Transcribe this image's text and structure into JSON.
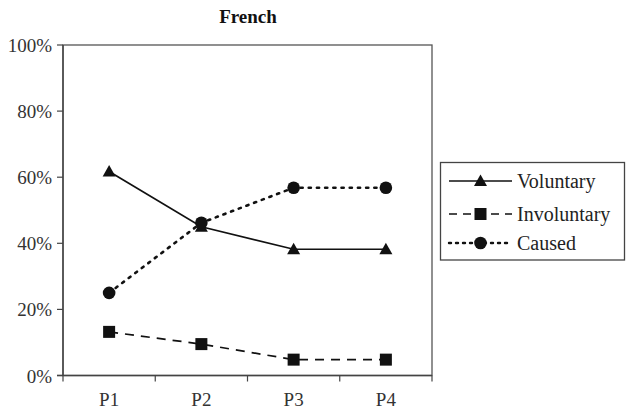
{
  "chart_data": {
    "type": "line",
    "title": "French",
    "xlabel": "",
    "ylabel": "",
    "categories": [
      "P1",
      "P2",
      "P3",
      "P4"
    ],
    "series": [
      {
        "name": "Voluntary",
        "values": [
          61.7,
          45.0,
          38.2,
          38.2
        ],
        "marker": "triangle",
        "line_style": "solid",
        "color": "#111111"
      },
      {
        "name": "Involuntary",
        "values": [
          13.2,
          9.5,
          4.8,
          4.8
        ],
        "marker": "square",
        "line_style": "dashed",
        "color": "#111111"
      },
      {
        "name": "Caused",
        "values": [
          25.0,
          46.2,
          56.8,
          56.8
        ],
        "marker": "circle",
        "line_style": "dotted",
        "color": "#111111"
      }
    ],
    "ylim": [
      0,
      100
    ],
    "y_ticks": [
      "0%",
      "20%",
      "40%",
      "60%",
      "80%",
      "100%"
    ],
    "y_tick_values": [
      0,
      20,
      40,
      60,
      80,
      100
    ],
    "grid": false,
    "legend_position": "right"
  }
}
